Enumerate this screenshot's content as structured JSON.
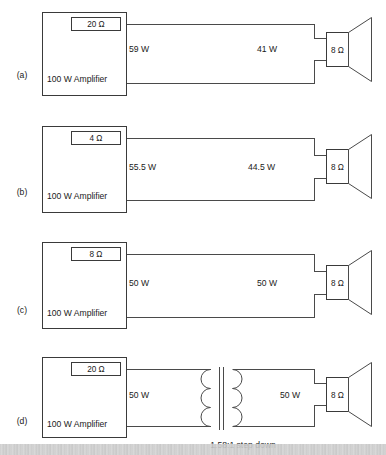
{
  "figure": {
    "type": "schematic-set",
    "speaker_label": "8 Ω",
    "amplifier_label": "100 W Amplifier"
  },
  "panels": [
    {
      "id": "a",
      "label": "(a)",
      "amplifier": "100 W Amplifier",
      "source_impedance": "20 Ω",
      "power_source": "59 W",
      "power_load": "41 W",
      "speaker_impedance": "8 Ω",
      "has_transformer": false
    },
    {
      "id": "b",
      "label": "(b)",
      "amplifier": "100 W Amplifier",
      "source_impedance": "4 Ω",
      "power_source": "55.5 W",
      "power_load": "44.5 W",
      "speaker_impedance": "8 Ω",
      "has_transformer": false
    },
    {
      "id": "c",
      "label": "(c)",
      "amplifier": "100 W Amplifier",
      "source_impedance": "8 Ω",
      "power_source": "50 W",
      "power_load": "50 W",
      "speaker_impedance": "8 Ω",
      "has_transformer": false
    },
    {
      "id": "d",
      "label": "(d)",
      "amplifier": "100 W Amplifier",
      "source_impedance": "20 Ω",
      "power_source": "50 W",
      "power_load": "50 W",
      "speaker_impedance": "8 Ω",
      "has_transformer": true,
      "transformer_label": "1.58:1 step down"
    }
  ],
  "colors": {
    "background": "#ffffff",
    "line": "#3a3a3a",
    "wire": "#4a4a4a",
    "text": "#1a1a1a"
  }
}
